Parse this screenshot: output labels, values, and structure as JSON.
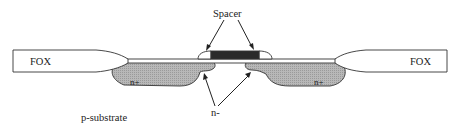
{
  "diagram": {
    "type": "mosfet-cross-section",
    "labels": {
      "spacer": "Spacer",
      "fox_left": "FOX",
      "fox_right": "FOX",
      "nplus_left": "n+",
      "nplus_right": "n+",
      "nminus": "n-",
      "substrate": "p-substrate"
    },
    "colors": {
      "background": "#ffffff",
      "oxide_fill": "#ffffff",
      "doped_region_fill": "#b4b4b4",
      "gate_fill": "#2a2a2a",
      "stroke": "#333333",
      "text": "#222222"
    }
  }
}
